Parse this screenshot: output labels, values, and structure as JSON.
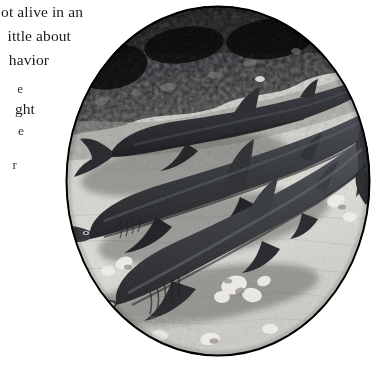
{
  "page": {
    "background_color": "#ffffff",
    "width": 381,
    "height": 382
  },
  "text_column": {
    "description": "Body text column cut off at the left edge of the scan; only the right-hand ends of each line are visible.",
    "text_color": "#1b1b1b",
    "lines": [
      {
        "text": "ot alive in an",
        "top": 2,
        "size": 15.5
      },
      {
        "text": "ittle about",
        "top": 26,
        "size": 15.5
      },
      {
        "text": "havior",
        "top": 50,
        "size": 15.5
      },
      {
        "text": "e",
        "top": 78,
        "size": 13.5
      },
      {
        "text": "ght",
        "top": 99,
        "size": 15.5
      },
      {
        "text": "e",
        "top": 121,
        "size": 13.5
      },
      {
        "text": "r",
        "top": 155,
        "size": 13.5
      }
    ]
  },
  "photograph": {
    "name": "circular-shark-photograph",
    "shape": "circle",
    "center_x": 218,
    "center_y": 181,
    "diameter": 306,
    "style": "black-and-white halftone",
    "border_color": "#000000",
    "subject": "Three reef sharks resting on a sandy seafloor",
    "scene": {
      "sand_color": "#d8d6cf",
      "dark_rock_color": "#15161a",
      "shark_body_color": "#2a2c31",
      "shark_count": 3,
      "sharks": [
        {
          "name": "shark-rear-left",
          "label": "Rear shark (upper left, facing left)",
          "depth": "background"
        },
        {
          "name": "shark-middle",
          "label": "Middle shark (centre, facing lower left)",
          "depth": "midground"
        },
        {
          "name": "shark-foreground",
          "label": "Foreground shark (lower, facing lower left)",
          "depth": "foreground"
        }
      ],
      "features": [
        "dark rocky ledge across upper portion",
        "rippled pale sand bottom",
        "scattered coral rubble and stones",
        "cast shadows beneath each shark"
      ]
    }
  }
}
